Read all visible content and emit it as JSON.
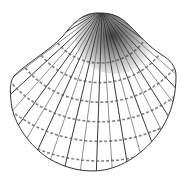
{
  "illustration": {
    "subject": "cockle shell (bivalve) line drawing",
    "style": "black ink on white, radial ribs with concentric growth bands, stippled shading near umbo",
    "colors": {
      "background": "#ffffff",
      "ink": "#222222",
      "shade": "#333333"
    },
    "rib_count": 30,
    "growth_bands": 7
  }
}
